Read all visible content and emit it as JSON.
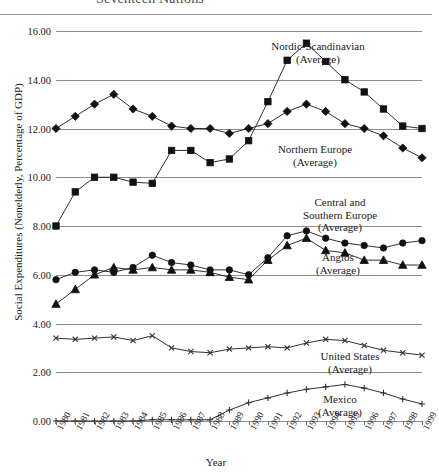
{
  "chart_data": {
    "type": "line",
    "title": "Seventeen Nations",
    "xlabel": "Year",
    "ylabel": "Social Expenditures (Nonelderly, Percentage of GDP)",
    "grid": true,
    "legend_position": "inline-right",
    "xlim": [
      1980,
      1999
    ],
    "ylim": [
      0.0,
      16.0
    ],
    "ytick_labels": [
      "16.00",
      "14.00",
      "12.00",
      "10.00",
      "8.00",
      "6.00",
      "4.00",
      "2.00",
      "0.00"
    ],
    "ytick_values": [
      16,
      14,
      12,
      10,
      8,
      6,
      4,
      2,
      0
    ],
    "categories": [
      1980,
      1981,
      1982,
      1983,
      1984,
      1985,
      1986,
      1987,
      1988,
      1989,
      1990,
      1991,
      1992,
      1993,
      1994,
      1995,
      1996,
      1997,
      1998,
      1999
    ],
    "xtick_labels": [
      "1980",
      "1981",
      "1982",
      "1983",
      "1984",
      "1985",
      "1986",
      "1987",
      "1988",
      "1989",
      "1990",
      "1991",
      "1992",
      "1993",
      "1994",
      "1995",
      "1996",
      "1997",
      "1998",
      "1999"
    ],
    "series": [
      {
        "name": "Nordic-Scandinavian (Average)",
        "label_line1": "Nordic-Scandinavian",
        "label_line2": "(Average)",
        "marker": "square",
        "values": [
          8.0,
          9.4,
          10.0,
          10.0,
          9.8,
          9.75,
          11.1,
          11.1,
          10.6,
          10.75,
          11.5,
          13.1,
          14.8,
          15.5,
          14.75,
          14.0,
          13.5,
          12.8,
          12.1,
          12.0
        ]
      },
      {
        "name": "Northern Europe (Average)",
        "label_line1": "Northern Europe",
        "label_line2": "(Average)",
        "marker": "diamond",
        "values": [
          12.0,
          12.5,
          13.0,
          13.4,
          12.8,
          12.5,
          12.1,
          12.0,
          12.0,
          11.8,
          12.0,
          12.2,
          12.7,
          13.0,
          12.7,
          12.2,
          12.0,
          11.7,
          11.2,
          10.8
        ]
      },
      {
        "name": "Central and Southern Europe (Average)",
        "label_line1": "Central and",
        "label_line2": "Southern Europe",
        "label_line3": "(Average)",
        "marker": "circle",
        "values": [
          5.8,
          6.1,
          6.2,
          6.1,
          6.3,
          6.8,
          6.5,
          6.4,
          6.2,
          6.2,
          6.0,
          6.7,
          7.6,
          7.8,
          7.5,
          7.3,
          7.2,
          7.1,
          7.3,
          7.4
        ]
      },
      {
        "name": "Anglos (Average)",
        "label_line1": "Anglos",
        "label_line2": "(Average)",
        "marker": "triangle",
        "values": [
          4.8,
          5.4,
          6.0,
          6.3,
          6.2,
          6.3,
          6.2,
          6.2,
          6.1,
          5.9,
          5.8,
          6.6,
          7.2,
          7.5,
          7.0,
          6.9,
          6.6,
          6.6,
          6.4,
          6.4
        ]
      },
      {
        "name": "United States (Average)",
        "label_line1": "United States",
        "label_line2": "(Average)",
        "marker": "x",
        "values": [
          3.4,
          3.35,
          3.4,
          3.45,
          3.3,
          3.5,
          3.0,
          2.85,
          2.8,
          2.95,
          3.0,
          3.05,
          3.0,
          3.2,
          3.35,
          3.3,
          3.1,
          2.9,
          2.8,
          2.7
        ]
      },
      {
        "name": "Mexico (Average)",
        "label_line1": "Mexico",
        "label_line2": "(Average)",
        "marker": "plus",
        "values": [
          0.0,
          0.0,
          0.0,
          0.0,
          0.0,
          0.05,
          0.05,
          0.05,
          0.05,
          0.45,
          0.75,
          0.95,
          1.15,
          1.3,
          1.4,
          1.5,
          1.35,
          1.15,
          0.9,
          0.7
        ]
      }
    ]
  },
  "series_labels": [
    {
      "name": "nordic-scandinavian",
      "lines": [
        "Nordic-Scandinavian",
        "(Average)"
      ],
      "x": 318,
      "y": 40
    },
    {
      "name": "northern-europe",
      "lines": [
        "Northern Europe",
        "(Average)"
      ],
      "x": 315,
      "y": 143
    },
    {
      "name": "central-southern-europe",
      "lines": [
        "Central and",
        "Southern Europe",
        "(Average)"
      ],
      "x": 340,
      "y": 196
    },
    {
      "name": "anglos",
      "lines": [
        "Anglos",
        "(Average)"
      ],
      "x": 338,
      "y": 251
    },
    {
      "name": "united-states",
      "lines": [
        "United States",
        "(Average)"
      ],
      "x": 350,
      "y": 350
    },
    {
      "name": "mexico",
      "lines": [
        "Mexico",
        "(Average)"
      ],
      "x": 340,
      "y": 393
    }
  ]
}
